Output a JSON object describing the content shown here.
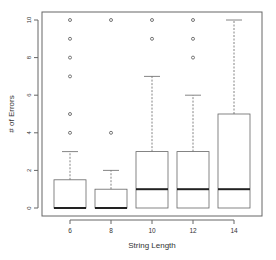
{
  "chart_data": {
    "type": "boxplot",
    "title": "",
    "xlabel": "String Length",
    "ylabel": "# of Errors",
    "categories": [
      "6",
      "8",
      "10",
      "12",
      "14"
    ],
    "yticks": [
      0,
      2,
      4,
      6,
      8,
      10
    ],
    "ylim": [
      0,
      10
    ],
    "grid": false,
    "legend": null,
    "boxes": [
      {
        "category": "6",
        "whisker_low": 0,
        "q1": 0,
        "median": 0,
        "q3": 1.5,
        "whisker_high": 3,
        "outliers": [
          4,
          5,
          7,
          8,
          9,
          10
        ]
      },
      {
        "category": "8",
        "whisker_low": 0,
        "q1": 0,
        "median": 0,
        "q3": 1,
        "whisker_high": 2,
        "outliers": [
          4,
          10
        ]
      },
      {
        "category": "10",
        "whisker_low": 0,
        "q1": 0,
        "median": 1,
        "q3": 3,
        "whisker_high": 7,
        "outliers": [
          9,
          10
        ]
      },
      {
        "category": "12",
        "whisker_low": 0,
        "q1": 0,
        "median": 1,
        "q3": 3,
        "whisker_high": 6,
        "outliers": [
          8,
          9,
          10
        ]
      },
      {
        "category": "14",
        "whisker_low": 0,
        "q1": 0,
        "median": 1,
        "q3": 5,
        "whisker_high": 10,
        "outliers": []
      }
    ]
  }
}
